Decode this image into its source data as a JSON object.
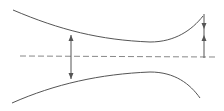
{
  "diagram": {
    "title": "",
    "colors": {
      "background": "#ffffff",
      "stroke": "#555555",
      "centerline": "#888888"
    },
    "top_wall": {
      "label": "",
      "path": "M 13 10 C 60 30, 100 40, 150 42 C 175 42, 192 30, 203 16"
    },
    "bottom_wall": {
      "label": "",
      "path": "M 12 103 C 55 84, 100 74, 150 72 C 175 72, 190 84, 200 98"
    },
    "centerline": {
      "label": "",
      "x1": 20,
      "y1": 56,
      "x2": 215,
      "y2": 57,
      "dash": "6,3"
    },
    "left_dimension": {
      "label": "",
      "x": 71,
      "y_top": 35,
      "y_bottom": 79,
      "type": "double-arrow-outward"
    },
    "right_dimension": {
      "label": "",
      "x": 204,
      "y_top": 14,
      "y_bottom": 58,
      "arrow_down_tip": 29,
      "arrow_up_tip": 35,
      "type": "arrows-facing-inward"
    }
  }
}
